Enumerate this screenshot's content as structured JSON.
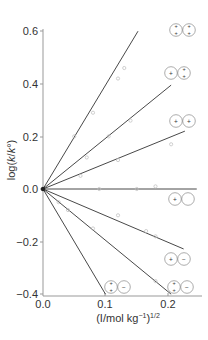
{
  "chart_data": {
    "type": "line",
    "title": "",
    "xlabel": "(I/mol kg⁻¹)¹ᐟ²",
    "xlabel_parts": {
      "main": "(I/mol kg",
      "sup1": "−1",
      "close": ")",
      "sup2": "1/2"
    },
    "ylabel": "log(k/k°)",
    "ylabel_parts": {
      "pre": "log(",
      "k1": "k",
      "slash": "/",
      "k2": "k",
      "sup": "°",
      "post": ")"
    },
    "xlim": [
      0.0,
      0.24
    ],
    "ylim": [
      -0.4,
      0.6
    ],
    "x_ticks": [
      "0.0",
      "0.1",
      "0.2"
    ],
    "x_tick_values": [
      0.0,
      0.1,
      0.2
    ],
    "y_ticks": [
      "0.6",
      "0.4",
      "0.2",
      "0.0",
      "−0.2",
      "−0.4"
    ],
    "y_tick_values": [
      0.6,
      0.4,
      0.2,
      0.0,
      -0.2,
      -0.4
    ],
    "grid": false,
    "legend_position": "none (ion-pair symbols annotate each line end)",
    "series": [
      {
        "name": "2+ / 2+",
        "ion_a": "2+",
        "ion_b": "2+",
        "slope": 3.95,
        "x_end": 0.152,
        "y_end": 0.6,
        "points": [
          [
            0.05,
            0.2
          ],
          [
            0.08,
            0.29
          ],
          [
            0.12,
            0.42
          ],
          [
            0.13,
            0.46
          ]
        ]
      },
      {
        "name": "+ / 2+",
        "ion_a": "+",
        "ion_b": "2+",
        "slope": 1.93,
        "x_end": 0.205,
        "y_end": 0.395,
        "points": [
          [
            0.07,
            0.12
          ],
          [
            0.105,
            0.2
          ],
          [
            0.14,
            0.26
          ]
        ]
      },
      {
        "name": "+ / +",
        "ion_a": "+",
        "ion_b": "+",
        "slope": 0.97,
        "x_end": 0.227,
        "y_end": 0.22,
        "points": [
          [
            0.06,
            0.05
          ],
          [
            0.12,
            0.11
          ],
          [
            0.205,
            0.17
          ]
        ]
      },
      {
        "name": "+ / neutral",
        "ion_a": "+",
        "ion_b": "0",
        "slope": 0.0,
        "x_end": 0.246,
        "y_end": 0.0,
        "points": [
          [
            0.09,
            0.0
          ],
          [
            0.15,
            0.0
          ],
          [
            0.18,
            0.01
          ]
        ]
      },
      {
        "name": "+ / −",
        "ion_a": "+",
        "ion_b": "−",
        "slope": -1.01,
        "x_end": 0.225,
        "y_end": -0.228,
        "points": [
          [
            0.12,
            -0.1
          ],
          [
            0.165,
            -0.16
          ],
          [
            0.18,
            -0.18
          ]
        ]
      },
      {
        "name": "2+ / −",
        "ion_a": "2+",
        "ion_b": "−",
        "slope": -1.95,
        "x_end": 0.205,
        "y_end": -0.4,
        "points": [
          [
            0.025,
            -0.05
          ],
          [
            0.04,
            -0.08
          ],
          [
            0.08,
            -0.15
          ],
          [
            0.18,
            -0.35
          ]
        ]
      },
      {
        "name": "2+ / − (steep)",
        "ion_a": "2+",
        "ion_b": "−",
        "slope": -4.0,
        "x_end": 0.1,
        "y_end": -0.4,
        "points": []
      }
    ],
    "annotations": [
      {
        "label": "ion pair 2+,2+",
        "a": "+ +",
        "b": "+ +"
      },
      {
        "label": "ion pair +,2+",
        "a": "+",
        "b": "+ +"
      },
      {
        "label": "ion pair +,+",
        "a": "+",
        "b": "+"
      },
      {
        "label": "ion pair +,0",
        "a": "+",
        "b": ""
      },
      {
        "label": "ion pair +,−",
        "a": "+",
        "b": "−"
      },
      {
        "label": "ion pair 2+,− (near 0.2)",
        "a": "+ +",
        "b": "−"
      },
      {
        "label": "ion pair 2+,− (near 0.1)",
        "a": "+ +",
        "b": "−"
      }
    ]
  },
  "colors": {
    "line": "#333333",
    "axis": "#999999",
    "marker": "#bbbbbb",
    "text": "#333333"
  }
}
